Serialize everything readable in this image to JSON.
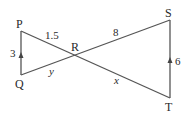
{
  "diagram": {
    "points": {
      "P": {
        "label": "P",
        "x": 21,
        "y": 31
      },
      "Q": {
        "label": "Q",
        "x": 21,
        "y": 75
      },
      "R": {
        "label": "R",
        "x": 76,
        "y": 56
      },
      "S": {
        "label": "S",
        "x": 170,
        "y": 20
      },
      "T": {
        "label": "T",
        "x": 170,
        "y": 98
      }
    },
    "lengths": {
      "PQ": "3",
      "PR": "1.5",
      "QR": "y",
      "RS": "8",
      "RT": "x",
      "ST": "6"
    },
    "line_color": "#555555"
  }
}
